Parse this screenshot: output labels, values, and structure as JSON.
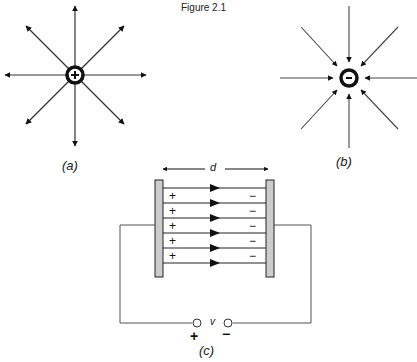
{
  "title": "Figure 2.1",
  "panels": {
    "a": {
      "caption": "(a)",
      "charge_sign": "+",
      "field_direction": "outward",
      "num_field_lines": 8
    },
    "b": {
      "caption": "(b)",
      "charge_sign": "-",
      "field_direction": "inward",
      "num_field_lines": 8
    },
    "c": {
      "caption": "(c)",
      "separation_label": "d",
      "voltage_label": "v",
      "terminal_plus": "+",
      "terminal_minus": "−",
      "left_plate_signs": [
        "+",
        "+",
        "+",
        "+",
        "+"
      ],
      "right_plate_signs": [
        "−",
        "−",
        "−",
        "−",
        "−"
      ],
      "num_field_lines": 6,
      "field_direction": "left-to-right"
    }
  },
  "colors": {
    "line": "#222222",
    "plate_fill": "#cccccc",
    "wire": "#555555"
  }
}
